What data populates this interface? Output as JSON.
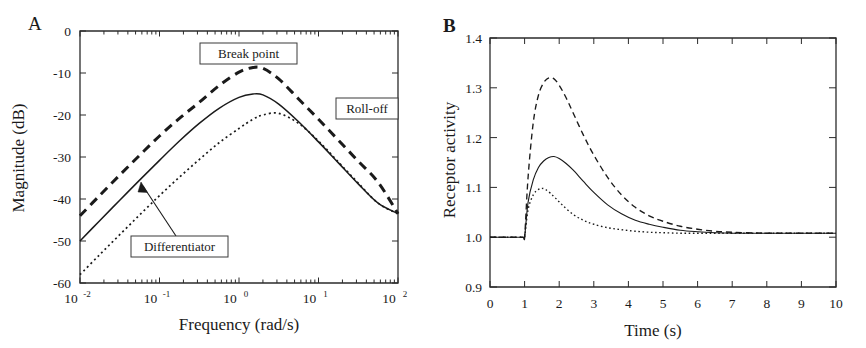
{
  "figure": {
    "panels": [
      {
        "letter": "A",
        "name": "bode-magnitude-panel"
      },
      {
        "letter": "B",
        "name": "receptor-activity-panel"
      }
    ]
  },
  "panel_a": {
    "letter": "A",
    "xlabel": "Frequency (rad/s)",
    "ylabel": "Magnitude (dB)",
    "xtick_labels": [
      "10",
      "10",
      "10",
      "10",
      "10"
    ],
    "xtick_exponents": [
      "-2",
      "-1",
      "0",
      "1",
      "2"
    ],
    "ytick_labels": [
      "0",
      "-10",
      "-20",
      "-30",
      "-40",
      "-50",
      "-60"
    ],
    "annotations": [
      {
        "id": "break-point",
        "label": "Break point"
      },
      {
        "id": "roll-off",
        "label": "Roll-off"
      },
      {
        "id": "differentiator",
        "label": "Differentiator"
      }
    ]
  },
  "panel_b": {
    "letter": "B",
    "xlabel": "Time (s)",
    "ylabel": "Receptor activity",
    "xtick_labels": [
      "0",
      "1",
      "2",
      "3",
      "4",
      "5",
      "6",
      "7",
      "8",
      "9",
      "10"
    ],
    "ytick_labels": [
      "0.9",
      "1.0",
      "1.1",
      "1.2",
      "1.3",
      "1.4"
    ]
  },
  "chart_data": [
    {
      "type": "line",
      "id": "panel-a-bode-magnitude",
      "title": "",
      "xlabel": "Frequency (rad/s)",
      "ylabel": "Magnitude (dB)",
      "xscale": "log",
      "xlim": [
        0.01,
        100
      ],
      "ylim": [
        -60,
        0
      ],
      "xticks": [
        0.01,
        0.1,
        1,
        10,
        100
      ],
      "xtick_labels": [
        "10^-2",
        "10^-1",
        "10^0",
        "10^1",
        "10^2"
      ],
      "yticks": [
        0,
        -10,
        -20,
        -30,
        -40,
        -50,
        -60
      ],
      "grid": false,
      "legend": "none",
      "annotations": [
        {
          "text": "Break point",
          "target": "dashed-curve-peak"
        },
        {
          "text": "Roll-off",
          "target": "high-frequency-slope"
        },
        {
          "text": "Differentiator",
          "target": "solid-curve-rising-slope"
        }
      ],
      "series": [
        {
          "name": "dashed",
          "style": "dashed",
          "x": [
            0.01,
            0.0178,
            0.0316,
            0.0562,
            0.1,
            0.178,
            0.316,
            0.562,
            1.0,
            1.5,
            2.0,
            3.16,
            5.62,
            10.0,
            17.8,
            31.6,
            56.2,
            100.0
          ],
          "y": [
            -44.0,
            -39.1,
            -34.3,
            -29.6,
            -25.0,
            -20.8,
            -17.0,
            -13.0,
            -9.8,
            -8.7,
            -8.9,
            -11.4,
            -16.2,
            -21.0,
            -26.0,
            -31.0,
            -36.0,
            -43.5
          ]
        },
        {
          "name": "solid",
          "style": "solid",
          "x": [
            0.01,
            0.0178,
            0.0316,
            0.0562,
            0.1,
            0.178,
            0.316,
            0.562,
            1.0,
            1.5,
            2.0,
            3.16,
            5.62,
            10.0,
            17.8,
            31.6,
            56.2,
            100.0
          ],
          "y": [
            -50.0,
            -45.1,
            -40.3,
            -35.5,
            -30.8,
            -26.2,
            -22.0,
            -18.4,
            -15.8,
            -15.0,
            -15.2,
            -17.4,
            -21.6,
            -26.4,
            -31.4,
            -36.4,
            -41.0,
            -43.5
          ]
        },
        {
          "name": "dotted",
          "style": "dotted",
          "x": [
            0.01,
            0.0178,
            0.0316,
            0.0562,
            0.1,
            0.178,
            0.316,
            0.562,
            1.0,
            1.5,
            2.0,
            3.16,
            5.62,
            10.0,
            17.8,
            31.6,
            56.2,
            100.0
          ],
          "y": [
            -58.0,
            -53.2,
            -48.5,
            -43.8,
            -39.2,
            -34.8,
            -30.6,
            -26.6,
            -23.2,
            -21.0,
            -20.0,
            -19.6,
            -22.0,
            -26.2,
            -31.2,
            -36.2,
            -41.0,
            -43.5
          ]
        }
      ]
    },
    {
      "type": "line",
      "id": "panel-b-receptor-activity",
      "title": "",
      "xlabel": "Time (s)",
      "ylabel": "Receptor activity",
      "xscale": "linear",
      "xlim": [
        0,
        10
      ],
      "ylim": [
        0.9,
        1.4
      ],
      "xticks": [
        0,
        1,
        2,
        3,
        4,
        5,
        6,
        7,
        8,
        9,
        10
      ],
      "yticks": [
        0.9,
        1.0,
        1.1,
        1.2,
        1.3,
        1.4
      ],
      "grid": false,
      "legend": "none",
      "series": [
        {
          "name": "dashed",
          "style": "dashed",
          "x": [
            0.0,
            0.5,
            0.95,
            1.0,
            1.1,
            1.25,
            1.4,
            1.55,
            1.7,
            1.85,
            2.0,
            2.2,
            2.4,
            2.7,
            3.0,
            3.4,
            3.8,
            4.2,
            4.6,
            5.0,
            5.5,
            6.0,
            6.5,
            7.0,
            8.0,
            9.0,
            10.0
          ],
          "y": [
            1.0,
            1.0,
            1.0,
            1.0,
            1.12,
            1.23,
            1.285,
            1.31,
            1.32,
            1.318,
            1.305,
            1.28,
            1.25,
            1.205,
            1.165,
            1.12,
            1.085,
            1.06,
            1.043,
            1.032,
            1.022,
            1.016,
            1.012,
            1.01,
            1.008,
            1.008,
            1.008
          ]
        },
        {
          "name": "solid",
          "style": "solid",
          "x": [
            0.0,
            0.5,
            0.95,
            1.0,
            1.1,
            1.25,
            1.4,
            1.55,
            1.7,
            1.85,
            2.0,
            2.2,
            2.4,
            2.7,
            3.0,
            3.4,
            3.8,
            4.2,
            4.6,
            5.0,
            5.5,
            6.0,
            6.5,
            7.0,
            8.0,
            9.0,
            10.0
          ],
          "y": [
            1.0,
            1.0,
            1.0,
            1.0,
            1.07,
            1.115,
            1.14,
            1.153,
            1.16,
            1.162,
            1.158,
            1.148,
            1.135,
            1.112,
            1.09,
            1.065,
            1.047,
            1.034,
            1.026,
            1.02,
            1.014,
            1.011,
            1.009,
            1.008,
            1.008,
            1.008,
            1.008
          ]
        },
        {
          "name": "dotted",
          "style": "dotted",
          "x": [
            0.0,
            0.5,
            0.95,
            1.0,
            1.1,
            1.25,
            1.4,
            1.5,
            1.6,
            1.75,
            1.9,
            2.1,
            2.4,
            2.7,
            3.0,
            3.4,
            3.8,
            4.2,
            4.6,
            5.0,
            5.5,
            6.0,
            6.5,
            7.0,
            8.0,
            9.0,
            10.0
          ],
          "y": [
            1.0,
            1.0,
            1.0,
            1.0,
            1.055,
            1.085,
            1.096,
            1.098,
            1.096,
            1.088,
            1.078,
            1.064,
            1.046,
            1.034,
            1.026,
            1.019,
            1.015,
            1.012,
            1.01,
            1.009,
            1.008,
            1.008,
            1.008,
            1.008,
            1.008,
            1.008,
            1.008
          ]
        }
      ]
    }
  ]
}
